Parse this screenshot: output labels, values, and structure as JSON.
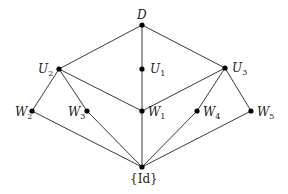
{
  "diagram": {
    "type": "hasse-diagram",
    "nodes": [
      {
        "id": "D",
        "label": "D",
        "sub": "",
        "x": 142,
        "y": 25,
        "lx": 137,
        "ly": 19,
        "italic": true
      },
      {
        "id": "U1",
        "label": "U",
        "sub": "1",
        "x": 142,
        "y": 69,
        "lx": 150,
        "ly": 73,
        "italic": true
      },
      {
        "id": "U2",
        "label": "U",
        "sub": "2",
        "x": 59,
        "y": 69,
        "lx": 38,
        "ly": 73,
        "italic": true
      },
      {
        "id": "U3",
        "label": "U",
        "sub": "3",
        "x": 225,
        "y": 68,
        "lx": 232,
        "ly": 72,
        "italic": true
      },
      {
        "id": "W1",
        "label": "W",
        "sub": "1",
        "x": 142,
        "y": 111,
        "lx": 148,
        "ly": 116,
        "italic": true
      },
      {
        "id": "W2",
        "label": "W",
        "sub": "2",
        "x": 32,
        "y": 111,
        "lx": 15,
        "ly": 116,
        "italic": true
      },
      {
        "id": "W3",
        "label": "W",
        "sub": "3",
        "x": 87,
        "y": 111,
        "lx": 68,
        "ly": 116,
        "italic": true
      },
      {
        "id": "W4",
        "label": "W",
        "sub": "4",
        "x": 197,
        "y": 111,
        "lx": 203,
        "ly": 116,
        "italic": true
      },
      {
        "id": "W5",
        "label": "W",
        "sub": "5",
        "x": 251,
        "y": 111,
        "lx": 257,
        "ly": 116,
        "italic": true
      },
      {
        "id": "Id",
        "label": "{Id}",
        "sub": "",
        "x": 142,
        "y": 167,
        "lx": 130,
        "ly": 183,
        "italic": false
      }
    ],
    "edges": [
      [
        "D",
        "U2"
      ],
      [
        "D",
        "U1"
      ],
      [
        "D",
        "U3"
      ],
      [
        "U1",
        "W1"
      ],
      [
        "U2",
        "W2"
      ],
      [
        "U2",
        "W3"
      ],
      [
        "U2",
        "W1"
      ],
      [
        "U3",
        "W1"
      ],
      [
        "U3",
        "W4"
      ],
      [
        "U3",
        "W5"
      ],
      [
        "W2",
        "Id"
      ],
      [
        "W3",
        "Id"
      ],
      [
        "W1",
        "Id"
      ],
      [
        "W4",
        "Id"
      ],
      [
        "W5",
        "Id"
      ]
    ]
  }
}
